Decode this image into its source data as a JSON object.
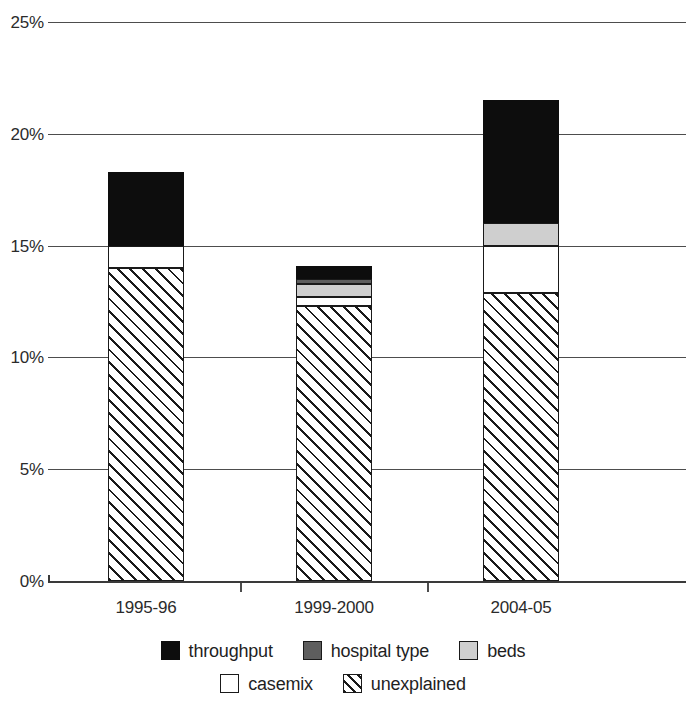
{
  "chart_data": {
    "type": "bar",
    "subtype": "stacked-bar",
    "title": "",
    "subtitle": "",
    "xlabel": "",
    "ylabel": "",
    "categories": [
      "1995-96",
      "1999-2000",
      "2004-05"
    ],
    "ylim": [
      0,
      25
    ],
    "y_ticks": [
      0,
      5,
      10,
      15,
      20,
      25
    ],
    "y_tick_labels": [
      "0%",
      "5%",
      "10%",
      "15%",
      "20%",
      "25%"
    ],
    "y_unit": "%",
    "grid": true,
    "grid_axis": "y",
    "legend_position": "bottom",
    "stack_order_bottom_to_top": [
      "unexplained",
      "casemix",
      "beds",
      "hospital type",
      "throughput"
    ],
    "series": [
      {
        "name": "unexplained",
        "color": "#ffffff",
        "pattern": "diagonal-hatch",
        "values": [
          14.0,
          12.3,
          12.9
        ]
      },
      {
        "name": "casemix",
        "color": "#ffffff",
        "pattern": "solid",
        "values": [
          1.0,
          0.4,
          2.1
        ]
      },
      {
        "name": "beds",
        "color": "#cfcfcf",
        "pattern": "solid",
        "values": [
          0.0,
          0.6,
          1.0
        ]
      },
      {
        "name": "hospital type",
        "color": "#5e5e5e",
        "pattern": "solid",
        "values": [
          0.0,
          0.2,
          0.0
        ]
      },
      {
        "name": "throughput",
        "color": "#0d0d0d",
        "pattern": "solid",
        "values": [
          3.3,
          0.6,
          5.5
        ]
      }
    ],
    "totals": [
      18.3,
      14.1,
      21.5
    ],
    "cumulative_tops": {
      "1995-96": {
        "unexplained": 14.0,
        "casemix": 15.0,
        "beds": 15.0,
        "hospital type": 15.0,
        "throughput": 18.3
      },
      "1999-2000": {
        "unexplained": 12.3,
        "casemix": 12.7,
        "beds": 13.3,
        "hospital type": 13.5,
        "throughput": 14.1
      },
      "2004-05": {
        "unexplained": 12.9,
        "casemix": 15.0,
        "beds": 16.0,
        "hospital type": 16.0,
        "throughput": 21.5
      }
    }
  },
  "axis": {
    "y_tick_labels": [
      "25%",
      "20%",
      "15%",
      "10%",
      "5%",
      "0%"
    ]
  },
  "legend": {
    "rows": [
      [
        {
          "label": "throughput",
          "swatch": "throughput"
        },
        {
          "label": "hospital type",
          "swatch": "hospital-type"
        },
        {
          "label": "beds",
          "swatch": "beds"
        }
      ],
      [
        {
          "label": "casemix",
          "swatch": "casemix"
        },
        {
          "label": "unexplained",
          "swatch": "unexplained"
        }
      ]
    ]
  },
  "colors": {
    "throughput": "#0d0d0d",
    "hospital_type": "#5e5e5e",
    "beds": "#cfcfcf",
    "casemix": "#ffffff",
    "unexplained_hatch": "#1a1a1a",
    "gridline": "#4d4d4d",
    "axis": "#3a3a3a",
    "text": "#1f1f1f",
    "background": "#ffffff"
  }
}
